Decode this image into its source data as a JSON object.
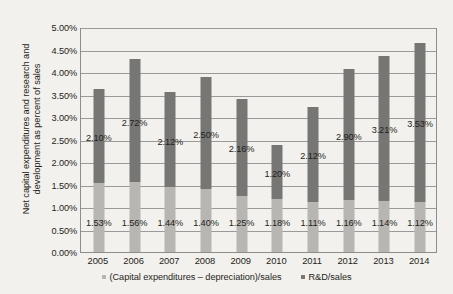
{
  "chart_data": {
    "type": "bar",
    "stacked": true,
    "title": "",
    "subtitle": "",
    "xlabel": "",
    "ylabel": "Net capital expenditures and research and development as percent of sales",
    "ylabel_lines": [
      "Net capital expenditures and research and",
      "development as percent of sales"
    ],
    "categories": [
      "2005",
      "2006",
      "2007",
      "2008",
      "2009",
      "2010",
      "2011",
      "2012",
      "2013",
      "2014"
    ],
    "series": [
      {
        "name": "(Capital expenditures – depreciation)/sales",
        "color": "#b7b6b2",
        "values": [
          1.53,
          1.56,
          1.44,
          1.4,
          1.25,
          1.18,
          1.11,
          1.16,
          1.14,
          1.12
        ],
        "labels": [
          "1.53%",
          "1.56%",
          "1.44%",
          "1.40%",
          "1.25%",
          "1.18%",
          "1.11%",
          "1.16%",
          "1.14%",
          "1.12%"
        ]
      },
      {
        "name": "R&D/sales",
        "color": "#767674",
        "values": [
          2.1,
          2.72,
          2.12,
          2.5,
          2.16,
          1.2,
          2.12,
          2.9,
          3.21,
          3.53
        ],
        "labels": [
          "2.10%",
          "2.72%",
          "2.12%",
          "2.50%",
          "2.16%",
          "1.20%",
          "2.12%",
          "2.90%",
          "3.21%",
          "3.53%"
        ]
      }
    ],
    "totals": [
      3.63,
      4.28,
      3.56,
      3.9,
      3.41,
      2.38,
      3.23,
      4.06,
      4.35,
      4.65
    ],
    "ylim": [
      0,
      5
    ],
    "ytick_step": 0.5,
    "ytick_labels": [
      "0.00%",
      "0.50%",
      "1.00%",
      "1.50%",
      "2.00%",
      "2.50%",
      "3.00%",
      "3.50%",
      "4.00%",
      "4.50%",
      "5.00%"
    ],
    "ytick_values": [
      0,
      0.5,
      1.0,
      1.5,
      2.0,
      2.5,
      3.0,
      3.5,
      4.0,
      4.5,
      5.0
    ],
    "grid": true,
    "legend_position": "bottom"
  },
  "legend": {
    "items": [
      {
        "label": "(Capital expenditures – depreciation)/sales",
        "color": "#b7b6b2"
      },
      {
        "label": "R&D/sales",
        "color": "#767674"
      }
    ]
  },
  "colors": {
    "background": "#f3f1ed",
    "plot_border": "#8d8d8d",
    "gridline": "#9a9a9a",
    "text": "#231f20",
    "capex_series": "#b7b6b2",
    "rnd_series": "#767674"
  }
}
